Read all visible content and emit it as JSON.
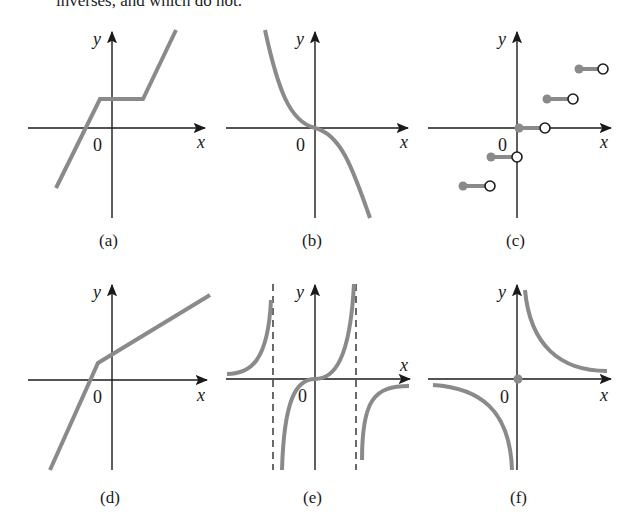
{
  "page": {
    "top_text": "inverses, and which do not."
  },
  "axes": {
    "x_label": "x",
    "y_label": "y",
    "origin_label": "0"
  },
  "panels": [
    {
      "id": "a",
      "caption": "(a)",
      "description": "Piecewise linear: rising line, horizontal segment, rising line (not one-to-one)"
    },
    {
      "id": "b",
      "caption": "(b)",
      "description": "Decreasing cubic-like curve through origin, y = -x^3"
    },
    {
      "id": "c",
      "caption": "(c)",
      "description": "Step (floor) function with filled left endpoints and open right endpoints"
    },
    {
      "id": "d",
      "caption": "(d)",
      "description": "Piecewise linear increasing function with a bend left of origin"
    },
    {
      "id": "e",
      "caption": "(e)",
      "description": "Tangent-like curve with vertical dashed asymptotes"
    },
    {
      "id": "f",
      "caption": "(f)",
      "description": "Reciprocal-like hyperbola branches with point at origin"
    }
  ],
  "colors": {
    "curve": "#8a8a8a",
    "axis": "#1a1a1a",
    "background": "#ffffff"
  }
}
